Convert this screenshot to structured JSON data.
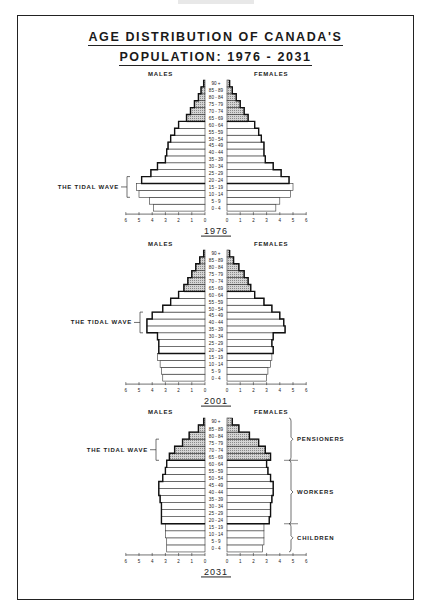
{
  "title": {
    "line1": "AGE DISTRIBUTION OF CANADA'S",
    "line2": "POPULATION: 1976 - 2031"
  },
  "labels": {
    "males": "MALES",
    "females": "FEMALES",
    "tidal_wave": "THE TIDAL WAVE",
    "pensioners": "PENSIONERS",
    "workers": "WORKERS",
    "children": "CHILDREN"
  },
  "chart_data": [
    {
      "type": "bar",
      "subtype": "population-pyramid",
      "title": "1976",
      "xlabel": "",
      "ylabel": "Age group",
      "xlim": [
        0,
        6
      ],
      "ticks": [
        6,
        5,
        4,
        3,
        2,
        1,
        0,
        0,
        1,
        2,
        3,
        4,
        5,
        6
      ],
      "categories": [
        "0 - 4",
        "5 - 9",
        "10 - 14",
        "15 - 19",
        "20 - 24",
        "25 - 29",
        "30 - 34",
        "35 - 39",
        "40 - 44",
        "45 - 49",
        "50 - 54",
        "55 - 59",
        "60 - 64",
        "65 - 69",
        "70 - 74",
        "75 - 79",
        "80 - 84",
        "85 - 89",
        "90 +"
      ],
      "series": [
        {
          "name": "MALES",
          "values": [
            3.9,
            4.2,
            5.0,
            5.2,
            4.8,
            4.1,
            3.6,
            3.0,
            2.9,
            2.8,
            2.6,
            2.3,
            2.0,
            1.4,
            1.1,
            0.8,
            0.5,
            0.3,
            0.1
          ]
        },
        {
          "name": "FEMALES",
          "values": [
            3.7,
            4.0,
            4.8,
            5.0,
            4.7,
            4.1,
            3.5,
            2.9,
            2.8,
            2.8,
            2.6,
            2.4,
            2.1,
            1.6,
            1.3,
            1.0,
            0.7,
            0.4,
            0.2
          ]
        }
      ],
      "annotations": [
        {
          "text": "THE TIDAL WAVE",
          "ages": [
            "10 - 14",
            "15 - 19",
            "20 - 24"
          ]
        }
      ],
      "shaded_groups": [
        "65 - 69",
        "70 - 74",
        "75 - 79",
        "80 - 84",
        "85 - 89",
        "90 +"
      ]
    },
    {
      "type": "bar",
      "subtype": "population-pyramid",
      "title": "2001",
      "xlim": [
        0,
        6
      ],
      "ticks": [
        6,
        5,
        4,
        3,
        2,
        1,
        0,
        0,
        1,
        2,
        3,
        4,
        5,
        6
      ],
      "categories": [
        "0 - 4",
        "5 - 9",
        "10 - 14",
        "15 - 19",
        "20 - 24",
        "25 - 29",
        "30 - 34",
        "35 - 39",
        "40 - 44",
        "45 - 49",
        "50 - 54",
        "55 - 59",
        "60 - 64",
        "65 - 69",
        "70 - 74",
        "75 - 79",
        "80 - 84",
        "85 - 89",
        "90 +"
      ],
      "series": [
        {
          "name": "MALES",
          "values": [
            3.2,
            3.3,
            3.4,
            3.6,
            3.5,
            3.5,
            3.6,
            4.4,
            4.4,
            4.0,
            3.2,
            2.6,
            2.0,
            1.6,
            1.3,
            1.0,
            0.7,
            0.4,
            0.1
          ]
        },
        {
          "name": "FEMALES",
          "values": [
            3.0,
            3.1,
            3.3,
            3.4,
            3.5,
            3.4,
            3.5,
            4.4,
            4.3,
            4.0,
            3.4,
            2.8,
            2.1,
            1.8,
            1.6,
            1.3,
            0.9,
            0.5,
            0.2
          ]
        }
      ],
      "annotations": [
        {
          "text": "THE TIDAL WAVE",
          "ages": [
            "35 - 39",
            "40 - 44",
            "45 - 49"
          ]
        }
      ],
      "shaded_groups": [
        "65 - 69",
        "70 - 74",
        "75 - 79",
        "80 - 84",
        "85 - 89",
        "90 +"
      ]
    },
    {
      "type": "bar",
      "subtype": "population-pyramid",
      "title": "2031",
      "xlim": [
        0,
        6
      ],
      "ticks": [
        6,
        5,
        4,
        3,
        2,
        1,
        0,
        0,
        1,
        2,
        3,
        4,
        5,
        6
      ],
      "categories": [
        "0 - 4",
        "5 - 9",
        "10 - 14",
        "15 - 19",
        "20 - 24",
        "25 - 29",
        "30 - 34",
        "35 - 39",
        "40 - 44",
        "45 - 49",
        "50 - 54",
        "55 - 59",
        "60 - 64",
        "65 - 69",
        "70 - 74",
        "75 - 79",
        "80 - 84",
        "85 - 89",
        "90 +"
      ],
      "series": [
        {
          "name": "MALES",
          "values": [
            2.9,
            2.9,
            3.0,
            3.0,
            3.3,
            3.3,
            3.3,
            3.4,
            3.5,
            3.5,
            3.2,
            3.0,
            2.9,
            2.7,
            2.3,
            1.7,
            1.2,
            0.5,
            0.1
          ]
        },
        {
          "name": "FEMALES",
          "values": [
            2.7,
            2.8,
            2.8,
            2.8,
            3.2,
            3.3,
            3.3,
            3.4,
            3.5,
            3.5,
            3.3,
            3.1,
            3.0,
            3.3,
            2.9,
            2.4,
            1.7,
            0.9,
            0.4
          ]
        }
      ],
      "annotations": [
        {
          "text": "THE TIDAL WAVE",
          "ages": [
            "65 - 69",
            "70 - 74",
            "75 - 79"
          ]
        },
        {
          "text": "PENSIONERS",
          "ages": [
            "65 - 69",
            "90 +"
          ]
        },
        {
          "text": "WORKERS",
          "ages": [
            "20 - 24",
            "60 - 64"
          ]
        },
        {
          "text": "CHILDREN",
          "ages": [
            "0 - 4",
            "15 - 19"
          ]
        }
      ],
      "shaded_groups": [
        "65 - 69",
        "70 - 74",
        "75 - 79",
        "80 - 84",
        "85 - 89",
        "90 +"
      ]
    }
  ]
}
